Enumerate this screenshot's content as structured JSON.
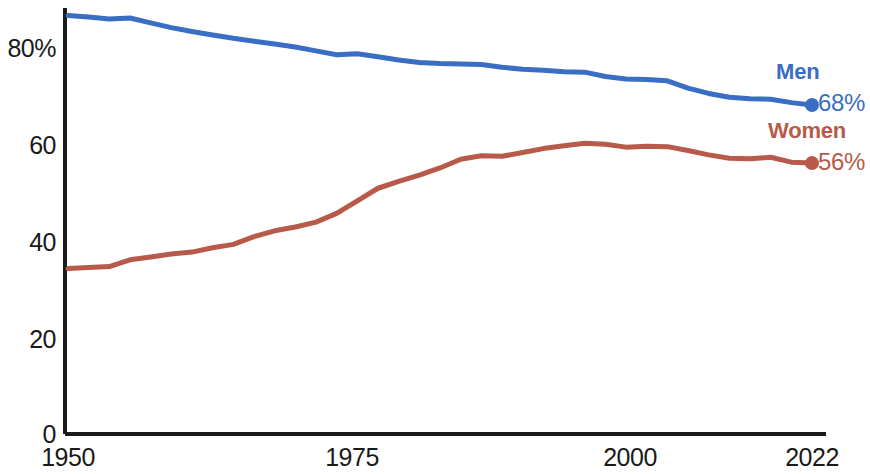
{
  "chart_data": {
    "type": "line",
    "title": "",
    "subtitle": "",
    "xlabel": "",
    "ylabel": "",
    "xlim": [
      1950,
      2022
    ],
    "ylim": [
      0,
      90
    ],
    "grid": false,
    "legend_position": "right-inline",
    "x_ticks": [
      "1950",
      "1975",
      "2000",
      "2022"
    ],
    "x_tick_values": [
      1950,
      1975,
      2000,
      2022
    ],
    "y_ticks": [
      "0",
      "20",
      "40",
      "60",
      "80%"
    ],
    "y_tick_values": [
      0,
      20,
      40,
      60,
      80
    ],
    "series": [
      {
        "name": "Men",
        "color": "#3a6ec4",
        "end_label": "68%",
        "end_value": 68,
        "x": [
          1950,
          1952,
          1954,
          1956,
          1958,
          1960,
          1962,
          1964,
          1966,
          1968,
          1970,
          1972,
          1974,
          1976,
          1978,
          1980,
          1982,
          1984,
          1986,
          1988,
          1990,
          1992,
          1994,
          1996,
          1998,
          2000,
          2002,
          2004,
          2006,
          2008,
          2010,
          2012,
          2014,
          2016,
          2018,
          2020,
          2022
        ],
        "values": [
          86.5,
          86.2,
          85.8,
          86.0,
          85.0,
          84.0,
          83.2,
          82.5,
          81.8,
          81.2,
          80.6,
          80.0,
          79.2,
          78.4,
          78.6,
          78.0,
          77.3,
          76.8,
          76.6,
          76.5,
          76.4,
          75.8,
          75.4,
          75.2,
          74.9,
          74.8,
          73.9,
          73.4,
          73.3,
          73.0,
          71.5,
          70.4,
          69.6,
          69.3,
          69.2,
          68.5,
          68.0
        ]
      },
      {
        "name": "Women",
        "color": "#b85a4a",
        "end_label": "56%",
        "end_value": 56,
        "x": [
          1950,
          1952,
          1954,
          1956,
          1958,
          1960,
          1962,
          1964,
          1966,
          1968,
          1970,
          1972,
          1974,
          1976,
          1978,
          1980,
          1982,
          1984,
          1986,
          1988,
          1990,
          1992,
          1994,
          1996,
          1998,
          2000,
          2002,
          2004,
          2006,
          2008,
          2010,
          2012,
          2014,
          2016,
          2018,
          2020,
          2022
        ],
        "values": [
          34.2,
          34.4,
          34.6,
          36.0,
          36.6,
          37.2,
          37.6,
          38.5,
          39.2,
          40.8,
          42.0,
          42.8,
          43.8,
          45.6,
          48.2,
          50.8,
          52.2,
          53.5,
          55.0,
          56.8,
          57.5,
          57.4,
          58.2,
          59.0,
          59.6,
          60.1,
          59.9,
          59.3,
          59.5,
          59.4,
          58.6,
          57.7,
          57.0,
          56.9,
          57.2,
          56.2,
          56.0
        ]
      }
    ]
  },
  "axis": {
    "y_label_80": "80%",
    "y_label_60": "60",
    "y_label_40": "40",
    "y_label_20": "20",
    "y_label_0": "0",
    "x_label_1950": "1950",
    "x_label_1975": "1975",
    "x_label_2000": "2000",
    "x_label_2022": "2022"
  },
  "legend": {
    "men_name": "Men",
    "men_value": "68%",
    "women_name": "Women",
    "women_value": "56%"
  },
  "colors": {
    "men": "#3a6ec4",
    "women": "#b85a4a",
    "axis": "#1a1a1a"
  }
}
